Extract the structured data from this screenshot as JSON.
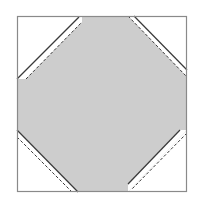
{
  "diagram": {
    "colors": {
      "background": "#ffffff",
      "fill": "#cdcdcd",
      "outline": "#8a8a8a",
      "seam": "#3a3a3a",
      "corner": "#ffffff"
    },
    "outer_square": {
      "x": 17,
      "y": 16,
      "width": 170,
      "height": 176
    },
    "center_octagon_points": "79,16 128,16 187,73 187,130 187,130 128,192 78,192 17,132 17,79",
    "corners": [
      {
        "name": "top-left",
        "white_points": "17,16 79,16 17,79",
        "strip_points": "79,16 82,16 82,22 26,79 17,79 17,79",
        "solid_line": "17,79 79,17",
        "dashed_line": "26,79 82,22"
      },
      {
        "name": "top-right",
        "white_points": "134,16 187,16 187,70",
        "strip_points": "128,16 134,16 187,70 187,77",
        "solid_line": "134,16 187,70",
        "dashed_line": "128,16 187,77"
      },
      {
        "name": "bottom-left",
        "white_points": "17,137 17,192 72,192",
        "strip_points": "17,130 78,192 72,192 17,137",
        "solid_line": "17,130 78,192",
        "dashed_line": "17,137 72,192"
      },
      {
        "name": "bottom-right",
        "white_points": "187,130 187,192 128,192",
        "strip_points": "180,130 187,130 128,192 128,185",
        "solid_line": "180,130 128,184",
        "dashed_line": "187,133 131,190"
      }
    ]
  }
}
